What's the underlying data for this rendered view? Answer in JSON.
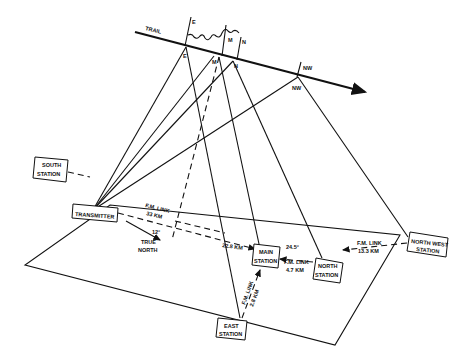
{
  "diagram": {
    "trail": {
      "label": "TRAIL",
      "points": {
        "E": "E",
        "M": "M",
        "N": "N",
        "NW": "NW"
      },
      "tick_labels": {
        "E": "I E",
        "M": "I M",
        "N": "I N",
        "NW": "I NW"
      }
    },
    "stations": {
      "south": "SOUTH STATION",
      "south_line1": "SOUTH",
      "south_line2": "STATION",
      "transmitter": "TRANSMITTER",
      "main_line1": "MAIN",
      "main_line2": "STATION",
      "east_line1": "EAST",
      "east_line2": "STATION",
      "north_line1": "NORTH",
      "north_line2": "STATION",
      "northwest_line1": "NORTH WEST",
      "northwest_line2": "STATION"
    },
    "links": {
      "transmitter_main_label": "F.M. LINK",
      "transmitter_main_distance": "33 KM",
      "main_segment_distance": "22.8 KM",
      "north_main_label": "F.M. LINK",
      "north_main_distance": "4.7 KM",
      "northwest_north_label": "F.M. LINK",
      "northwest_north_distance": "13.3 KM",
      "east_main_label": "F.M. LINK",
      "east_main_distance": "2.8 KM",
      "north_angle": "24.5°"
    },
    "bearing": {
      "angle": "12°",
      "label_line1": "TRUE",
      "label_line2": "NORTH"
    }
  }
}
